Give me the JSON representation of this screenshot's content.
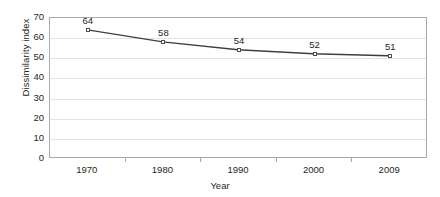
{
  "chart_data": {
    "type": "line",
    "title": "",
    "xlabel": "Year",
    "ylabel": "Dissimilarity index",
    "categories": [
      "1970",
      "1980",
      "1990",
      "2000",
      "2009"
    ],
    "values": [
      64,
      58,
      54,
      52,
      51
    ],
    "point_labels": [
      "64",
      "58",
      "54",
      "52",
      "51"
    ],
    "ylim": [
      0,
      70
    ],
    "yticks": [
      0,
      10,
      20,
      30,
      40,
      50,
      60,
      70
    ],
    "ytick_labels": [
      "0",
      "10",
      "20",
      "30",
      "40",
      "50",
      "60",
      "70"
    ],
    "grid": true,
    "legend": false,
    "series": [
      {
        "name": "Dissimilarity index",
        "values": [
          64,
          58,
          54,
          52,
          51
        ],
        "line_color": "#3f3f3f",
        "marker": "open-square",
        "marker_edge_color": "#4d4d4d",
        "marker_face_color": "#ffffff"
      }
    ],
    "colors": {
      "line": "#3f3f3f",
      "grid": "#e3e3e3",
      "frame": "#a9a9a9",
      "text": "#231f20",
      "background": "#ffffff"
    }
  }
}
